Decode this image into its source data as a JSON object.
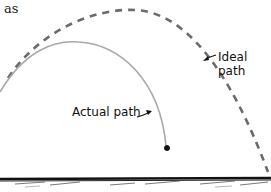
{
  "fragment_text": "as",
  "labels": {
    "ideal_line1": "Ideal",
    "ideal_line2": "path",
    "actual": "Actual path"
  },
  "colors": {
    "ideal_path": "#6b6b6b",
    "actual_path": "#a8a8a8",
    "ground": "#111111",
    "text": "#111111"
  }
}
